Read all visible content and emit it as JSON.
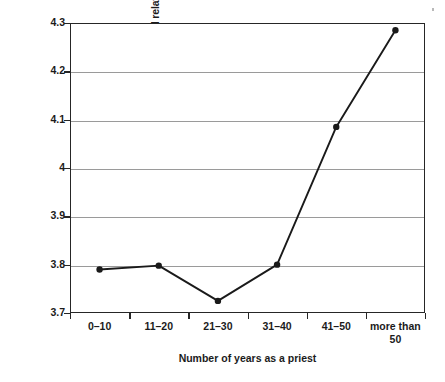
{
  "chart_data": {
    "type": "line",
    "title": "",
    "subtitle": "",
    "xlabel": "Number of years as a priest",
    "ylabel": "Mean of \"Growing up, I had a good relationship with my father\"",
    "categories": [
      "0–10",
      "11–20",
      "21–30",
      "31–40",
      "41–50",
      "more than\n50"
    ],
    "series": [
      {
        "name": "Mean rating",
        "values": [
          3.79,
          3.798,
          3.725,
          3.8,
          4.085,
          4.285
        ]
      }
    ],
    "ylim": [
      3.7,
      4.3
    ],
    "y_ticks": [
      3.7,
      3.8,
      3.9,
      4.0,
      4.1,
      4.2,
      4.3
    ],
    "y_tick_labels": [
      "3.7",
      "3.8",
      "3.9",
      "4",
      "4.1",
      "4.2",
      "4.3"
    ],
    "grid": true,
    "grid_axis": "y",
    "legend": "none",
    "legend_position": "",
    "marker": "filled-circle",
    "line_color": "#1a1a1a",
    "marker_color": "#1a1a1a",
    "grid_color": "#9a9a9a",
    "axis_color": "#262626",
    "background_color": "#ffffff"
  }
}
